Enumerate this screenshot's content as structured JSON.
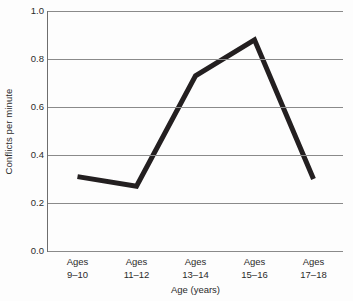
{
  "chart_data": {
    "type": "line",
    "title": "",
    "subtitle": "",
    "xlabel": "Age (years)",
    "ylabel": "Conflicts per minute",
    "categories": [
      "Ages\n9–10",
      "Ages\n11–12",
      "Ages\n13–14",
      "Ages\n15–16",
      "Ages\n17–18"
    ],
    "category_lines": [
      [
        "Ages",
        "9–10"
      ],
      [
        "Ages",
        "11–12"
      ],
      [
        "Ages",
        "13–14"
      ],
      [
        "Ages",
        "15–16"
      ],
      [
        "Ages",
        "17–18"
      ]
    ],
    "values": [
      0.31,
      0.27,
      0.73,
      0.88,
      0.3
    ],
    "ylim": [
      0.0,
      1.0
    ],
    "ytick_labels": [
      "1.0",
      "0.8",
      "0.6",
      "0.4",
      "0.2",
      "0.0"
    ],
    "ytick_values": [
      1.0,
      0.8,
      0.6,
      0.4,
      0.2,
      0.0
    ],
    "grid": true,
    "grid_axis": "y",
    "legend": false,
    "legend_position": "none",
    "line_color": "#231f20",
    "line_width_px": 5,
    "grid_color": "#8a8a8a",
    "axis_color": "#6e6e6e",
    "background_color": "#fdfdfd",
    "markers": false,
    "annotations": []
  }
}
